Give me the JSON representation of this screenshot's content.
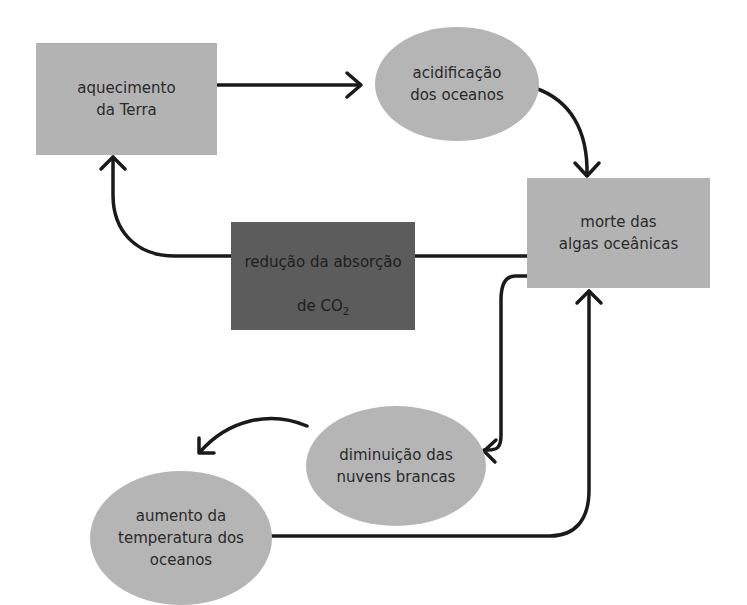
{
  "diagram": {
    "type": "flowchart",
    "nodes": [
      {
        "id": "aquecimento",
        "shape": "rectangle",
        "label": "aquecimento\nda Terra",
        "fill": "#b3b3b3"
      },
      {
        "id": "acidificacao",
        "shape": "ellipse",
        "label": "acidificação\ndos oceanos",
        "fill": "#b5b5b5"
      },
      {
        "id": "morte",
        "shape": "rectangle",
        "label": "morte das\nalgas oceânicas",
        "fill": "#b3b3b3"
      },
      {
        "id": "reducao",
        "shape": "rectangle",
        "label_main": "redução da absorção",
        "label_line2": "de CO",
        "label_sub": "2",
        "fill": "#5c5c5c"
      },
      {
        "id": "diminuicao",
        "shape": "ellipse",
        "label": "diminuição das\nnuvens brancas",
        "fill": "#b5b5b5"
      },
      {
        "id": "aumento",
        "shape": "ellipse",
        "label": "aumento da\ntemperatura dos\noceanos",
        "fill": "#b5b5b5"
      }
    ],
    "edges": [
      {
        "from": "aquecimento",
        "to": "acidificacao"
      },
      {
        "from": "acidificacao",
        "to": "morte"
      },
      {
        "from": "morte",
        "to": "aquecimento",
        "via": "reducao"
      },
      {
        "from": "morte",
        "to": "diminuicao"
      },
      {
        "from": "diminuicao",
        "to": "aumento"
      },
      {
        "from": "aumento",
        "to": "morte"
      }
    ],
    "colors": {
      "line": "#1a1a1a",
      "light_fill": "#b3b3b3",
      "dark_fill": "#5c5c5c"
    }
  }
}
